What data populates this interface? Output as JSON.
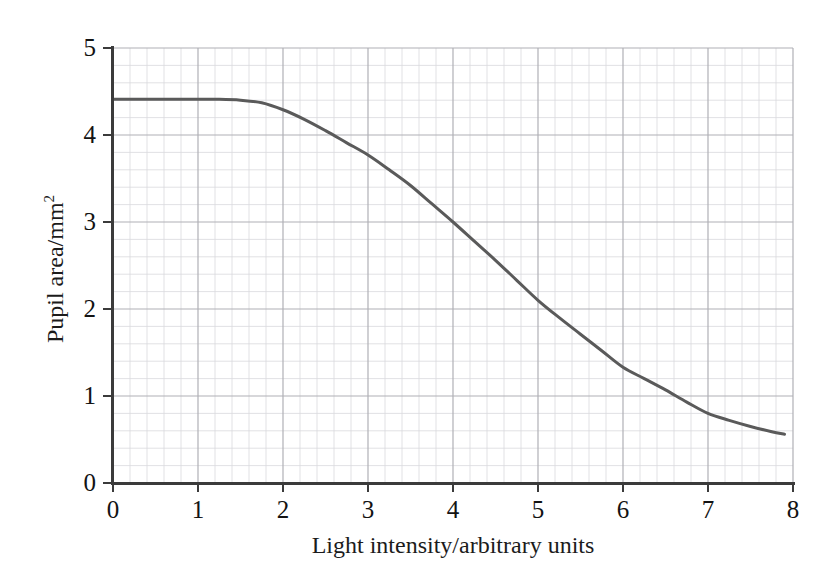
{
  "chart_data": {
    "type": "line",
    "title": "",
    "xlabel": "Light intensity/arbitrary units",
    "ylabel": "Pupil area/mm",
    "ylabel_sup": "2",
    "xlim": [
      0,
      8
    ],
    "ylim": [
      0,
      5
    ],
    "xticks": [
      "0",
      "1",
      "2",
      "3",
      "4",
      "5",
      "6",
      "7",
      "8"
    ],
    "yticks": [
      "0",
      "1",
      "2",
      "3",
      "4",
      "5"
    ],
    "xtick_values": [
      0,
      1,
      2,
      3,
      4,
      5,
      6,
      7,
      8
    ],
    "ytick_values": [
      0,
      1,
      2,
      3,
      4,
      5
    ],
    "grid": "major and minor, 5 minor divisions per major unit",
    "grid_color": "#b9b9bd",
    "minor_grid_color": "#d9d9dd",
    "legend": "none",
    "series": [
      {
        "name": "Pupil area vs light intensity",
        "color": "#5a5a5a",
        "line_width": 3,
        "x": [
          0.0,
          0.25,
          0.5,
          0.75,
          1.0,
          1.25,
          1.5,
          1.75,
          2.0,
          2.25,
          2.5,
          2.75,
          3.0,
          3.25,
          3.5,
          3.75,
          4.0,
          4.25,
          4.5,
          4.75,
          5.0,
          5.25,
          5.5,
          5.75,
          6.0,
          6.25,
          6.5,
          6.75,
          7.0,
          7.25,
          7.5,
          7.75,
          7.9
        ],
        "y": [
          4.41,
          4.41,
          4.41,
          4.41,
          4.41,
          4.41,
          4.4,
          4.37,
          4.29,
          4.18,
          4.05,
          3.91,
          3.77,
          3.6,
          3.42,
          3.21,
          3.0,
          2.78,
          2.56,
          2.33,
          2.1,
          1.9,
          1.71,
          1.52,
          1.33,
          1.2,
          1.07,
          0.93,
          0.8,
          0.72,
          0.65,
          0.59,
          0.56
        ]
      }
    ],
    "annotations": [],
    "readings": {
      "plateau_value": 4.41,
      "plateau_range_x": [
        0,
        1.5
      ],
      "midpoint": {
        "x": 4,
        "y": 3.0
      },
      "end_point": {
        "x": 7.9,
        "y": 0.56
      }
    }
  }
}
